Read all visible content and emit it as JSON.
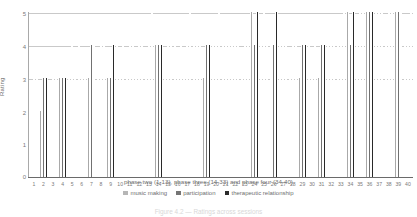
{
  "chart_data": {
    "type": "bar",
    "title": "",
    "xlabel": "phase two (1-13), phase three (14-33) and phase four (34-40)",
    "ylabel": "Rating",
    "ylim": [
      0,
      5
    ],
    "yticks": [
      0,
      1,
      2,
      3,
      4,
      5
    ],
    "grid": true,
    "legend_position": "bottom",
    "categories": [
      "1",
      "2",
      "3",
      "4",
      "5",
      "6",
      "7",
      "8",
      "9",
      "10",
      "11",
      "12",
      "13",
      "14",
      "15",
      "16",
      "17",
      "18",
      "19",
      "20",
      "21",
      "22",
      "23",
      "24",
      "25",
      "26",
      "27",
      "28",
      "29",
      "30",
      "31",
      "32",
      "33",
      "34",
      "35",
      "36",
      "37",
      "38",
      "39",
      "40"
    ],
    "series": [
      {
        "name": "music making",
        "color": "#b6b6b6",
        "values": [
          2,
          2,
          2,
          3,
          3,
          4,
          3,
          3,
          3,
          4,
          3,
          3,
          3,
          4,
          3,
          4,
          3,
          4,
          3,
          4,
          4,
          4,
          3,
          5,
          4,
          4,
          4,
          3,
          3,
          4,
          3,
          4,
          4,
          5,
          4,
          5,
          5,
          4,
          5,
          4
        ]
      },
      {
        "name": "participation",
        "color": "#757575",
        "values": [
          3,
          3,
          3,
          3,
          4,
          3,
          4,
          4,
          3,
          3,
          4,
          4,
          4,
          4,
          4,
          3,
          4,
          4,
          4,
          4,
          4,
          4,
          4,
          4,
          5,
          4,
          4,
          4,
          4,
          3,
          4,
          4,
          4,
          4,
          5,
          5,
          5,
          5,
          5,
          4
        ]
      },
      {
        "name": "therapeutic relationship",
        "color": "#2b2b2b",
        "values": [
          3,
          3,
          3,
          3,
          3,
          3,
          4,
          4,
          4,
          4,
          4,
          4,
          5,
          4,
          4,
          4,
          5,
          4,
          4,
          5,
          4,
          4,
          4,
          5,
          4,
          5,
          4,
          4,
          4,
          4,
          4,
          4,
          5,
          5,
          5,
          5,
          5,
          5,
          5,
          5
        ]
      }
    ]
  },
  "legend": {
    "items": [
      {
        "label": "music making"
      },
      {
        "label": "participation"
      },
      {
        "label": "therapeutic relationship"
      }
    ]
  },
  "caption": {
    "text": "Figure 4.2 — Ratings across sessions"
  }
}
